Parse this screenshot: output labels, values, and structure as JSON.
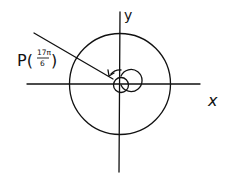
{
  "diagram": {
    "type": "unit-circle-angle",
    "axes": {
      "x_label": "x",
      "y_label": "y"
    },
    "point_label": {
      "prefix": "P(",
      "numerator": "17π",
      "denominator": "6",
      "suffix": ")"
    },
    "angle": "17π/6",
    "stroke_color": "#111111",
    "background": "#ffffff"
  }
}
